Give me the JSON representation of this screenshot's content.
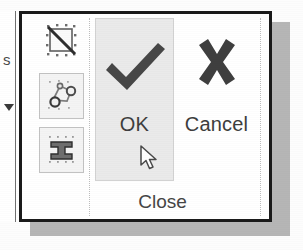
{
  "panel": {
    "title": "Close",
    "title_name": "close-panel-title"
  },
  "left_strip": {
    "clipped_letter": "s",
    "dropdown_arrow_icon": "triangle-down-icon"
  },
  "tools": [
    {
      "icon": "delete-constraints-icon",
      "label": "",
      "framed": false,
      "selected": false
    },
    {
      "icon": "auto-constrain-icon",
      "label": "",
      "framed": true,
      "selected": false
    },
    {
      "icon": "constraint-bar-icon",
      "label": "",
      "framed": true,
      "selected": false
    }
  ],
  "commands": [
    {
      "id": "ok",
      "label": "OK",
      "icon": "checkmark-icon",
      "highlighted": true
    },
    {
      "id": "cancel",
      "label": "Cancel",
      "icon": "x-mark-icon",
      "highlighted": false
    }
  ],
  "cursor": {
    "icon": "arrow-pointer-cursor",
    "x": 118,
    "y": 131
  },
  "colors": {
    "panel_border": "#1a1a1a",
    "panel_background": "#ffffff",
    "highlight_background": "#eaeaea",
    "highlight_border": "#d2d2d2",
    "glyph_dark": "#3d3d3d",
    "text": "#454545",
    "shadow": "#a9a9a9",
    "separator": "#bdbdbd"
  }
}
